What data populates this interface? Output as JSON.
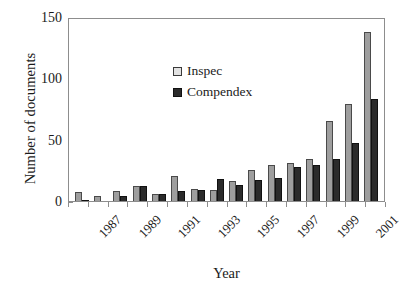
{
  "chart_data": {
    "type": "bar",
    "title": "",
    "xlabel": "Year",
    "ylabel": "Number of documents",
    "ylim": [
      0,
      150
    ],
    "yticks": [
      0,
      50,
      100,
      150
    ],
    "grid": false,
    "legend_position": "upper-left-inside",
    "categories": [
      "1987",
      "1988",
      "1989",
      "1990",
      "1991",
      "1992",
      "1993",
      "1994",
      "1995",
      "1996",
      "1997",
      "1998",
      "1999",
      "2000",
      "2001",
      "2002"
    ],
    "tick_labels_shown": [
      "1987",
      "",
      "1989",
      "",
      "1991",
      "",
      "1993",
      "",
      "1995",
      "",
      "1997",
      "",
      "1999",
      "",
      "2001",
      ""
    ],
    "series": [
      {
        "name": "Inspec",
        "color": "#9e9e9e",
        "values": [
          7,
          4,
          8,
          12,
          6,
          20,
          10,
          9,
          16,
          25,
          29,
          31,
          34,
          65,
          79,
          138
        ]
      },
      {
        "name": "Compendex",
        "color": "#2b2b2b",
        "values": [
          1,
          0,
          4,
          12,
          6,
          8,
          9,
          18,
          13,
          17,
          19,
          28,
          29,
          34,
          47,
          83
        ]
      }
    ]
  },
  "axis": {
    "y_title": "Number of documents",
    "x_title": "Year",
    "y_tick_labels": [
      "0",
      "50",
      "100",
      "150"
    ]
  },
  "legend": {
    "items": [
      {
        "label": "Inspec",
        "swatch": "light-gray-square"
      },
      {
        "label": "Compendex",
        "swatch": "dark-square"
      }
    ]
  }
}
